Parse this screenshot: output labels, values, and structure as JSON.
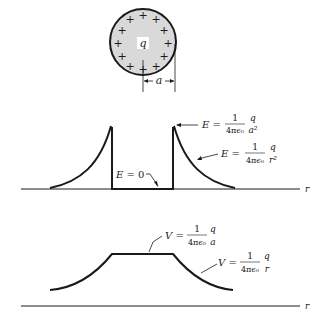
{
  "figure": {
    "sphere": {
      "charge_label": "q",
      "radius_label": "a",
      "charge_sign": "+",
      "fill_color": "#d9d9d9",
      "edge_color": "#1a1a1a"
    },
    "field_plot": {
      "axis_label": "r",
      "inside_label": "E = 0",
      "surface_label": {
        "lhs": "E =",
        "num": "1",
        "den": "4πϵ₀",
        "frac_num": "q",
        "frac_den": "a²"
      },
      "outside_label": {
        "lhs": "E =",
        "num": "1",
        "den": "4πϵ₀",
        "frac_num": "q",
        "frac_den": "r²"
      }
    },
    "potential_plot": {
      "axis_label": "r",
      "inside_label": {
        "lhs": "V =",
        "num": "1",
        "den": "4πϵ₀",
        "frac_num": "q",
        "frac_den": "a"
      },
      "outside_label": {
        "lhs": "V =",
        "num": "1",
        "den": "4πϵ₀",
        "frac_num": "q",
        "frac_den": "r"
      }
    }
  }
}
